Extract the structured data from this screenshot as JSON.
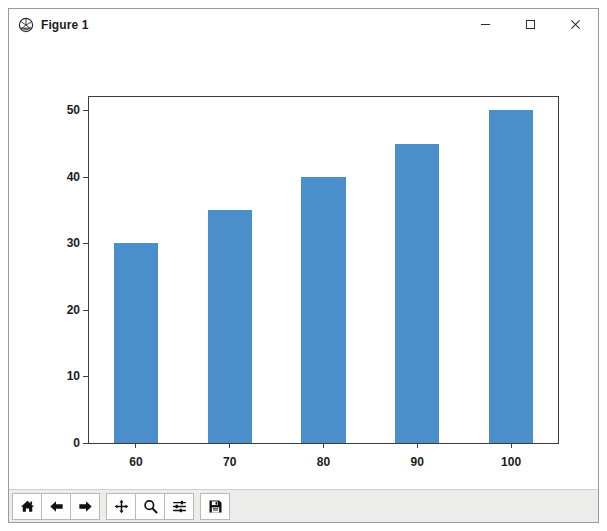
{
  "window": {
    "title": "Figure 1",
    "icon": "matplotlib-logo-icon",
    "controls": {
      "minimize": "–",
      "maximize": "□",
      "close": "×"
    }
  },
  "toolbar": {
    "buttons": [
      {
        "name": "home-icon",
        "tooltip": "Reset original view"
      },
      {
        "name": "back-arrow-icon",
        "tooltip": "Back to previous view"
      },
      {
        "name": "forward-arrow-icon",
        "tooltip": "Forward to next view"
      },
      {
        "name": "pan-move-icon",
        "tooltip": "Pan axes with left mouse, zoom with right"
      },
      {
        "name": "zoom-magnifier-icon",
        "tooltip": "Zoom to rectangle"
      },
      {
        "name": "configure-subplots-sliders-icon",
        "tooltip": "Configure subplots"
      },
      {
        "name": "save-floppy-disk-icon",
        "tooltip": "Save the figure"
      }
    ]
  },
  "chart_data": {
    "type": "bar",
    "title": "",
    "xlabel": "",
    "ylabel": "",
    "categories": [
      "60",
      "70",
      "80",
      "90",
      "100"
    ],
    "values": [
      30,
      35,
      40,
      45,
      50
    ],
    "ylim": [
      0,
      52
    ],
    "yticks": [
      0,
      10,
      20,
      30,
      40,
      50
    ],
    "ytick_labels": [
      "0",
      "10",
      "20",
      "30",
      "40",
      "50"
    ],
    "bar_color": "#4a8fcb",
    "grid": false,
    "legend": null,
    "background": "#ffffff",
    "axes_edge_color": "#3c3c3c"
  }
}
